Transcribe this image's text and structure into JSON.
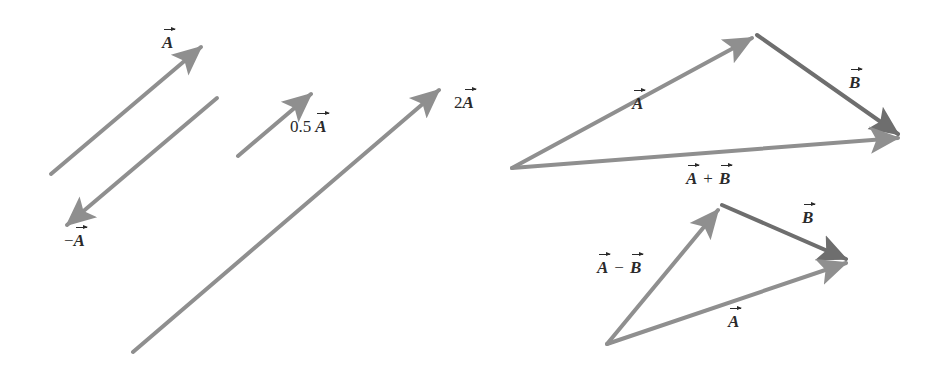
{
  "colors": {
    "vector_A": "#8f8f8f",
    "vector_B": "#6e6e6e",
    "label_text": "#2a2a2a",
    "background": "#ffffff"
  },
  "scalar_multiples": {
    "A": {
      "symbol": "A",
      "x1": 51,
      "y1": 174,
      "x2": 205,
      "y2": 44
    },
    "negA": {
      "prefix": "−",
      "symbol": "A",
      "x1": 217,
      "y1": 98,
      "x2": 63,
      "y2": 228
    },
    "halfA": {
      "coefficient": "0.5",
      "symbol": "A",
      "x1": 238,
      "y1": 156,
      "x2": 315,
      "y2": 91
    },
    "twoA": {
      "coefficient": "2",
      "symbol": "A",
      "x1": 133,
      "y1": 352,
      "x2": 443,
      "y2": 87
    }
  },
  "addition_triangle": {
    "A": {
      "symbol": "A",
      "x1": 512,
      "y1": 168,
      "x2": 757,
      "y2": 35
    },
    "B": {
      "symbol": "B",
      "x1": 757,
      "y1": 35,
      "x2": 903,
      "y2": 137
    },
    "sum": {
      "left": "A",
      "operator": "+",
      "right": "B",
      "x1": 512,
      "y1": 168,
      "x2": 903,
      "y2": 137
    }
  },
  "subtraction_triangle": {
    "diff": {
      "left": "A",
      "operator": "−",
      "right": "B",
      "x1": 607,
      "y1": 344,
      "x2": 722,
      "y2": 205
    },
    "B": {
      "symbol": "B",
      "x1": 722,
      "y1": 205,
      "x2": 851,
      "y2": 261
    },
    "A": {
      "symbol": "A",
      "x1": 607,
      "y1": 344,
      "x2": 851,
      "y2": 261
    }
  }
}
